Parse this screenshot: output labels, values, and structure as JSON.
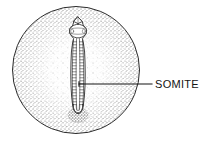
{
  "figure": {
    "name": "embryo-on-yolk-diagram",
    "type": "labeled-biological-diagram",
    "background_color": "#ffffff",
    "ink_color": "#1a1a1a",
    "stipple_color": "#4a4a4a"
  },
  "yolk": {
    "name": "yolk-sphere",
    "shape": "circle",
    "center_x": 76,
    "center_y": 70,
    "radius": 64,
    "outline_color": "#2a2a2a",
    "outline_width": 1,
    "fill": "stipple",
    "stipple_note": "dense near rim, sparse toward center"
  },
  "embryo": {
    "name": "embryo-body",
    "orientation": "vertical",
    "head_x": 78,
    "head_y": 21,
    "tail_x": 78,
    "tail_y": 118,
    "width": 13,
    "parts": [
      {
        "name": "head-tip",
        "label": "head tip"
      },
      {
        "name": "brain-vesicle",
        "label": "brain vesicle"
      },
      {
        "name": "neural-tube",
        "label": "neural tube"
      },
      {
        "name": "somite-column",
        "label": "somites"
      },
      {
        "name": "tail-bud",
        "label": "tail bud"
      },
      {
        "name": "blood-island",
        "label": "blood island"
      }
    ],
    "somite_count": 22
  },
  "labels": [
    {
      "id": "somite",
      "text": "SOMITE",
      "text_x": 155,
      "text_y": 88,
      "leader_from_x": 79,
      "leader_from_y": 84,
      "leader_to_x": 152,
      "leader_to_y": 84,
      "leader_elbow_x": 152,
      "leader_elbow_y": 84,
      "font_size": 11,
      "color": "#141414"
    }
  ]
}
